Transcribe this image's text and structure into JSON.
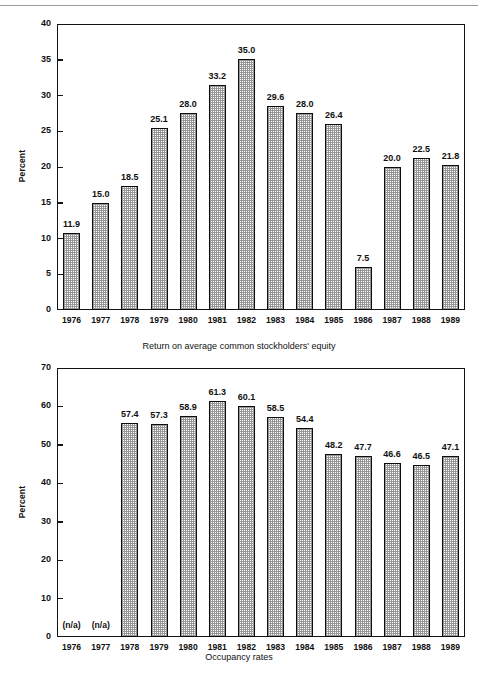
{
  "page": {
    "background": "#ffffff",
    "ink": "#111111",
    "rule_color": "#9a9a9a"
  },
  "chart_data": [
    {
      "id": "roe",
      "type": "bar",
      "title": "",
      "caption": "Return on average common stockholders' equity",
      "xlabel": "",
      "ylabel": "Percent",
      "ylim": [
        0,
        40
      ],
      "ytick_labels": [
        "0",
        "5",
        "10",
        "15",
        "20",
        "25",
        "30",
        "35",
        "40"
      ],
      "ytick_values": [
        0,
        5,
        10,
        15,
        20,
        25,
        30,
        35,
        40
      ],
      "grid": false,
      "legend": "none",
      "categories": [
        "1976",
        "1977",
        "1978",
        "1979",
        "1980",
        "1981",
        "1982",
        "1983",
        "1984",
        "1985",
        "1986",
        "1987",
        "1988",
        "1989"
      ],
      "values": [
        11.9,
        15.0,
        18.5,
        25.1,
        28.0,
        33.2,
        35.0,
        29.6,
        28.0,
        26.4,
        7.5,
        20.0,
        22.5,
        21.8
      ],
      "value_labels": [
        "11.9",
        "15.0",
        "18.5",
        "25.1",
        "28.0",
        "33.2",
        "35.0",
        "29.6",
        "28.0",
        "26.4",
        "7.5",
        "20.0",
        "22.5",
        "21.8"
      ],
      "drawn_heights": [
        10.8,
        15.0,
        17.3,
        25.4,
        27.6,
        31.5,
        35.1,
        28.5,
        27.6,
        26.0,
        6.0,
        20.0,
        21.3,
        20.3
      ]
    },
    {
      "id": "occupancy",
      "type": "bar",
      "title": "",
      "caption": "Occupancy rates",
      "xlabel": "",
      "ylabel": "Percent",
      "ylim": [
        0,
        70
      ],
      "ytick_labels": [
        "0",
        "10",
        "20",
        "30",
        "40",
        "50",
        "60",
        "70"
      ],
      "ytick_values": [
        0,
        10,
        20,
        30,
        40,
        50,
        60,
        70
      ],
      "grid": false,
      "legend": "none",
      "categories": [
        "1976",
        "1977",
        "1978",
        "1979",
        "1980",
        "1981",
        "1982",
        "1983",
        "1984",
        "1985",
        "1986",
        "1987",
        "1988",
        "1989"
      ],
      "values": [
        null,
        null,
        57.4,
        57.3,
        58.9,
        61.3,
        60.1,
        58.5,
        54.4,
        48.2,
        47.7,
        46.6,
        46.5,
        47.1
      ],
      "value_labels": [
        "(n/a)",
        "(n/a)",
        "57.4",
        "57.3",
        "58.9",
        "61.3",
        "60.1",
        "58.5",
        "54.4",
        "48.2",
        "47.7",
        "46.6",
        "46.5",
        "47.1"
      ],
      "drawn_heights": [
        null,
        null,
        55.7,
        55.4,
        57.6,
        61.3,
        60.0,
        57.3,
        54.4,
        47.7,
        47.0,
        45.4,
        44.8,
        47.0
      ],
      "missing_label": "(n/a)"
    }
  ]
}
